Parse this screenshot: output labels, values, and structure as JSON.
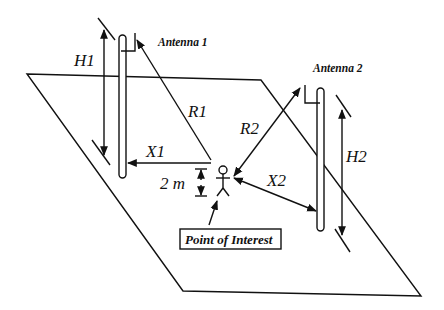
{
  "diagram": {
    "background": "#ffffff",
    "stroke_color": "#111111",
    "labels": {
      "antenna1": "Antenna 1",
      "antenna2": "Antenna 2",
      "h1": "H1",
      "h2": "H2",
      "r1": "R1",
      "r2": "R2",
      "x1": "X1",
      "x2": "X2",
      "height": "2 m",
      "poi": "Point of Interest"
    },
    "nodes": [
      {
        "id": "ground-plane",
        "type": "parallelogram"
      },
      {
        "id": "antenna-1",
        "type": "pole-with-antenna",
        "label": "Antenna 1"
      },
      {
        "id": "antenna-2",
        "type": "pole-with-antenna",
        "label": "Antenna 2"
      },
      {
        "id": "point-of-interest",
        "type": "person-figure",
        "label": "Point of Interest"
      }
    ],
    "edges": [
      {
        "from": "antenna-1-ground",
        "to": "antenna-1-top",
        "label": "H1",
        "kind": "height-dimension"
      },
      {
        "from": "antenna-1",
        "to": "point-of-interest",
        "label": "R1",
        "kind": "slant-range"
      },
      {
        "from": "antenna-1-pole",
        "to": "point-of-interest",
        "label": "X1",
        "kind": "horizontal-distance"
      },
      {
        "from": "antenna-2-ground",
        "to": "antenna-2-top",
        "label": "H2",
        "kind": "height-dimension"
      },
      {
        "from": "point-of-interest",
        "to": "antenna-2",
        "label": "R2",
        "kind": "slant-range"
      },
      {
        "from": "point-of-interest",
        "to": "antenna-2-pole",
        "label": "X2",
        "kind": "horizontal-distance"
      },
      {
        "from": "ground",
        "to": "point-of-interest",
        "label": "2 m",
        "kind": "height-offset"
      }
    ]
  }
}
